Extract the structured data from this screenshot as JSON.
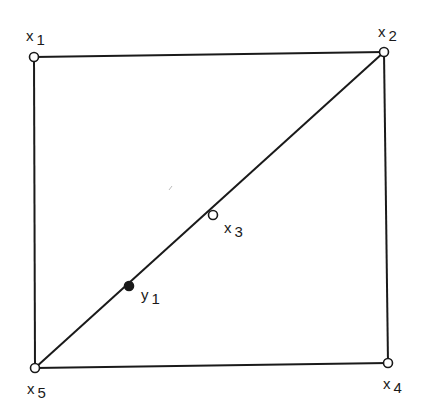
{
  "figure": {
    "stroke_color": "#1a1a1a",
    "background": "#ffffff",
    "nodes": [
      {
        "id": "x1",
        "base": "x",
        "sub": "1",
        "filled": false,
        "cx": 34,
        "cy": 57,
        "label_x": 26,
        "label_y": 28
      },
      {
        "id": "x2",
        "base": "x",
        "sub": "2",
        "filled": false,
        "cx": 384,
        "cy": 52,
        "label_x": 378,
        "label_y": 24
      },
      {
        "id": "x3",
        "base": "x",
        "sub": "3",
        "filled": false,
        "cx": 213,
        "cy": 215,
        "label_x": 224,
        "label_y": 220
      },
      {
        "id": "x4",
        "base": "x",
        "sub": "4",
        "filled": false,
        "cx": 388,
        "cy": 363,
        "label_x": 383,
        "label_y": 376
      },
      {
        "id": "x5",
        "base": "x",
        "sub": "5",
        "filled": false,
        "cx": 35,
        "cy": 368,
        "label_x": 27,
        "label_y": 381
      },
      {
        "id": "y1",
        "base": "y",
        "sub": "1",
        "filled": true,
        "cx": 129,
        "cy": 286,
        "label_x": 141,
        "label_y": 287
      }
    ],
    "edges": [
      {
        "from": "x1",
        "to": "x2"
      },
      {
        "from": "x2",
        "to": "x4"
      },
      {
        "from": "x4",
        "to": "x5"
      },
      {
        "from": "x5",
        "to": "x1"
      },
      {
        "from": "x5",
        "to": "x2"
      }
    ],
    "labels": {
      "x1": {
        "base": "x",
        "sub": "1"
      },
      "x2": {
        "base": "x",
        "sub": "2"
      },
      "x3": {
        "base": "x",
        "sub": "3"
      },
      "x4": {
        "base": "x",
        "sub": "4"
      },
      "x5": {
        "base": "x",
        "sub": "5"
      },
      "y1": {
        "base": "y",
        "sub": "1"
      }
    }
  }
}
